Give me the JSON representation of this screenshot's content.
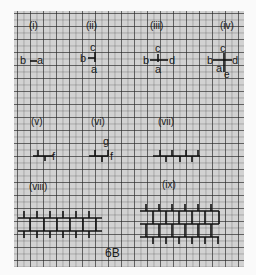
{
  "figure": {
    "caption": "6B",
    "panels": [
      {
        "id": "i",
        "label": "(i)",
        "letters": {
          "left": "b",
          "right": "a"
        }
      },
      {
        "id": "ii",
        "label": "(ii)",
        "letters": {
          "left": "b",
          "top": "c",
          "bottom": "a"
        }
      },
      {
        "id": "iii",
        "label": "(iii)",
        "letters": {
          "left": "b",
          "top": "c",
          "bottom": "a",
          "right": "d"
        }
      },
      {
        "id": "iv",
        "label": "(iv)",
        "letters": {
          "left": "b",
          "top": "c",
          "bottom": "a",
          "right": "d",
          "extra": "e"
        }
      },
      {
        "id": "v",
        "label": "(v)",
        "letters": {
          "right": "f"
        }
      },
      {
        "id": "vi",
        "label": "(vi)",
        "letters": {
          "top": "g",
          "right": "f"
        }
      },
      {
        "id": "vii",
        "label": "(vii)",
        "letters": {}
      },
      {
        "id": "viii",
        "label": "(viii)",
        "letters": {}
      },
      {
        "id": "ix",
        "label": "(ix)",
        "letters": {}
      }
    ]
  }
}
